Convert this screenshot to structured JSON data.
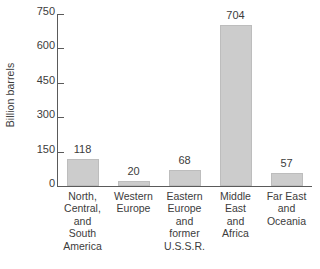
{
  "chart_data": {
    "type": "bar",
    "title": "",
    "xlabel": "",
    "ylabel": "Billion barrels",
    "ylim": [
      0,
      750
    ],
    "grid": false,
    "legend": false,
    "yticks": [
      750,
      600,
      450,
      300,
      150,
      0
    ],
    "ytick_labels": [
      "750",
      "600",
      "450",
      "300",
      "150",
      "0"
    ],
    "categories": [
      "North, Central, and South America",
      "Western Europe",
      "Eastern Europe and former U.S.S.R.",
      "Middle East and Africa",
      "Far East and Oceania"
    ],
    "category_lines": [
      [
        "North,",
        "Central,",
        "and",
        "South",
        "America"
      ],
      [
        "Western",
        "Europe"
      ],
      [
        "Eastern",
        "Europe",
        "and",
        "former",
        "U.S.S.R."
      ],
      [
        "Middle",
        "East",
        "and",
        "Africa"
      ],
      [
        "Far East",
        "and",
        "Oceania"
      ]
    ],
    "values": [
      118,
      20,
      68,
      704,
      57
    ],
    "value_labels": [
      "118",
      "20",
      "68",
      "704",
      "57"
    ],
    "bar_color": "#cccccc",
    "bar_border_color": "#bdbdbd",
    "axis_color": "#5a5a5a",
    "text_color": "#3c3c3c",
    "background_color": "#ffffff"
  }
}
